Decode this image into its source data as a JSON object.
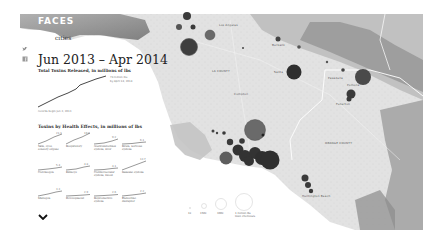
{
  "header": {
    "brand": "FACES",
    "subtitle_fragment": "cities"
  },
  "share_icons": [
    "twitter-icon",
    "facebook-icon"
  ],
  "summary": {
    "date_range": "Jun 2013 – Apr 2014",
    "total_title": "Total Toxins Released, in millions of lbs",
    "end_note_line1": "74 million lbs",
    "end_note_line2": "by April 14, 2014",
    "start_note": "records begin Jun 3, 2013"
  },
  "health_effects": {
    "title": "Toxins by Health Effects, in millions of lbs",
    "items": [
      {
        "label": "Skin, eyes, sensory organs",
        "value": "21.3"
      },
      {
        "label": "Respiratory",
        "value": "19.8"
      },
      {
        "label": "Gastrointestinal system, liver",
        "value": "9.2"
      },
      {
        "label": "Brain, nervous system",
        "value": "6.1"
      },
      {
        "label": "Carcinogen",
        "value": "5.4"
      },
      {
        "label": "Kidneys",
        "value": "4.8"
      },
      {
        "label": "Cardiovascular system, blood",
        "value": "4.1"
      },
      {
        "label": "Immune system",
        "value": "12.7"
      },
      {
        "label": "Mutagen",
        "value": "3.3"
      },
      {
        "label": "Development",
        "value": "2.9"
      },
      {
        "label": "Reproductive system",
        "value": "2.6"
      },
      {
        "label": "Endocrine disruptor",
        "value": "2.2"
      }
    ]
  },
  "map": {
    "labels": [
      {
        "text": "Los Angeles",
        "x": 224,
        "y": 25
      },
      {
        "text": "Burbank",
        "x": 272,
        "y": 43
      },
      {
        "text": "LA COUNTY",
        "x": 212,
        "y": 70
      },
      {
        "text": "Santa",
        "x": 274,
        "y": 70
      },
      {
        "text": "Compton",
        "x": 234,
        "y": 93
      },
      {
        "text": "Pasadena",
        "x": 330,
        "y": 76
      },
      {
        "text": "Pomona",
        "x": 347,
        "y": 83
      },
      {
        "text": "Fullerton",
        "x": 336,
        "y": 103
      },
      {
        "text": "ORANGE COUNTY",
        "x": 325,
        "y": 142
      },
      {
        "text": "Huntington Beach",
        "x": 302,
        "y": 195
      }
    ]
  },
  "legend": {
    "items": [
      {
        "label": "1k"
      },
      {
        "label": "150k"
      },
      {
        "label": "300k"
      },
      {
        "label": "1 million lbs"
      }
    ],
    "caption": "toxic chemicals"
  },
  "colors": {
    "bubble_dark": "#3a3a3a",
    "bubble_mid": "#5e5e5e",
    "land": "#e3e3e3",
    "mountain": "#9a9a9a"
  }
}
